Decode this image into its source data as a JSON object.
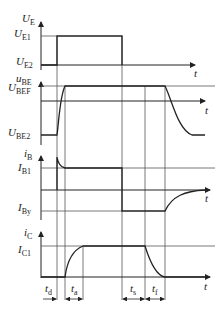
{
  "diagram": {
    "type": "switching-waveforms",
    "panels": [
      {
        "id": "input",
        "signal": "U",
        "signal_sub": "E",
        "levels": [
          {
            "sym": "U",
            "sub": "E1"
          },
          {
            "sym": "U",
            "sub": "E2"
          }
        ],
        "time_axis": "t"
      },
      {
        "id": "vbe",
        "signal": "u",
        "signal_sub": "BE",
        "levels": [
          {
            "sym": "U",
            "sub": "BEF"
          },
          {
            "sym": "U",
            "sub": "BE2"
          }
        ],
        "time_axis": "t"
      },
      {
        "id": "ib",
        "signal": "i",
        "signal_sub": "B",
        "levels": [
          {
            "sym": "I",
            "sub": "B1"
          },
          {
            "sym": "I",
            "sub": "By"
          }
        ],
        "time_axis": "t"
      },
      {
        "id": "ic",
        "signal": "i",
        "signal_sub": "C",
        "levels": [
          {
            "sym": "I",
            "sub": "C1"
          }
        ],
        "time_axis": "t"
      }
    ],
    "time_intervals": [
      {
        "sym": "t",
        "sub": "d"
      },
      {
        "sym": "t",
        "sub": "a"
      },
      {
        "sym": "t",
        "sub": "s"
      },
      {
        "sym": "t",
        "sub": "f"
      }
    ],
    "colors": {
      "line": "#222222",
      "guide": "#555555",
      "background": "#ffffff"
    }
  }
}
